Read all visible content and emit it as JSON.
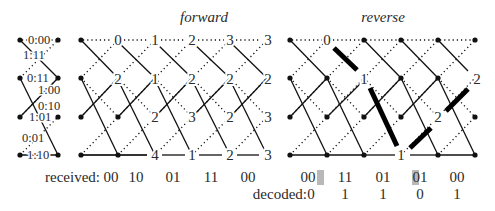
{
  "titles": {
    "forward": "forward",
    "reverse": "reverse"
  },
  "state_diagram": {
    "edges": [
      {
        "label": "0:00"
      },
      {
        "label": "1:11"
      },
      {
        "label": "0:11"
      },
      {
        "label": "1:00"
      },
      {
        "label": "0:10"
      },
      {
        "label": "1:01"
      },
      {
        "label": "0:01"
      },
      {
        "label": "1:10"
      }
    ]
  },
  "forward": {
    "path_metrics": [
      [
        "0",
        "1",
        "2",
        "3",
        "3"
      ],
      [
        "2",
        "1",
        "2",
        "2",
        "2"
      ],
      [
        "",
        "2",
        "3",
        "2",
        "3"
      ],
      [
        "4",
        "1",
        "2",
        "3",
        ""
      ]
    ]
  },
  "reverse": {
    "path_metrics": {
      "row0": "0",
      "row1_col2": "1",
      "row1_col5": "2",
      "row2_col4": "2",
      "row3_col3": "1"
    }
  },
  "received": {
    "label": "received:",
    "forward": [
      "00",
      "10",
      "01",
      "11",
      "00"
    ],
    "reverse": [
      "00",
      "11",
      "01",
      "01",
      "00"
    ],
    "highlighted": [
      {
        "symbol_index": 1,
        "bit_index": 1
      },
      {
        "symbol_index": 3,
        "bit_index": 0
      }
    ]
  },
  "decoded": {
    "label": "decoded:",
    "bits": [
      "0",
      "1",
      "1",
      "0",
      "1"
    ]
  },
  "colors": {
    "line": "#111111",
    "highlight": "#b8b8b8",
    "text": "#2a2a2a"
  }
}
